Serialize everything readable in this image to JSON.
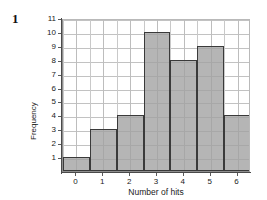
{
  "question": {
    "number": "1"
  },
  "chart_data": {
    "type": "bar",
    "title": "",
    "subtitle": "",
    "xlabel": "Number of hits",
    "ylabel": "Frequency",
    "categories": [
      "0",
      "1",
      "2",
      "3",
      "4",
      "5",
      "6"
    ],
    "values": [
      1,
      3,
      4,
      10,
      8,
      9,
      4
    ],
    "series": [
      {
        "name": "Frequency",
        "values": [
          1,
          3,
          4,
          10,
          8,
          9,
          4
        ]
      }
    ],
    "xlim": [
      -0.5,
      6.5
    ],
    "ylim": [
      0,
      11
    ],
    "x_ticks": [
      "0",
      "1",
      "2",
      "3",
      "4",
      "5",
      "6"
    ],
    "y_ticks": [
      "1",
      "2",
      "3",
      "4",
      "5",
      "6",
      "7",
      "8",
      "9",
      "10",
      "11"
    ],
    "grid": true,
    "grid_x_step": 0.5,
    "grid_y_step": 1,
    "legend": false,
    "legend_position": "none",
    "bar_width": 1,
    "colors": {
      "bar_fill": "#a0a0a0",
      "bar_edge": "#3a3a3a",
      "gridline": "#c5c5c5",
      "axis": "#4a4a4a",
      "text": "#1a1a1a",
      "background": "#ffffff"
    },
    "annotations": []
  }
}
